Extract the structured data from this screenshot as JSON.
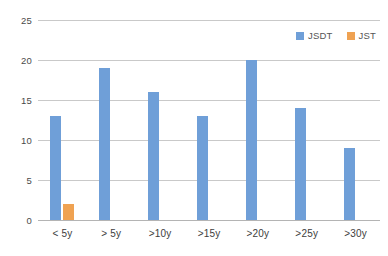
{
  "chart_data": {
    "type": "bar",
    "title": "",
    "subtitle": "",
    "xlabel": "",
    "ylabel": "",
    "categories": [
      "< 5y",
      "> 5y",
      ">10y",
      ">15y",
      ">20y",
      ">25y",
      ">30y"
    ],
    "series": [
      {
        "name": "JSDT",
        "color": "#6f9fd8",
        "values": [
          13,
          19,
          16,
          13,
          20,
          14,
          9
        ]
      },
      {
        "name": "JST",
        "color": "#efa252",
        "values": [
          2,
          0,
          0,
          0,
          0,
          0,
          0
        ]
      }
    ],
    "ylim": [
      0,
      25
    ],
    "yticks": [
      0,
      5,
      10,
      15,
      20,
      25
    ],
    "ytick_labels": [
      "0",
      "5",
      "10",
      "15",
      "20",
      "25"
    ],
    "grid": {
      "horizontal": true,
      "vertical": false,
      "color": "#c9c9c9"
    },
    "legend": {
      "position": "top-right",
      "orientation": "horizontal"
    },
    "background": "#ffffff"
  },
  "legend": {
    "entries": [
      {
        "label": "JSDT",
        "color": "#6f9fd8"
      },
      {
        "label": "JST",
        "color": "#efa252"
      }
    ]
  }
}
